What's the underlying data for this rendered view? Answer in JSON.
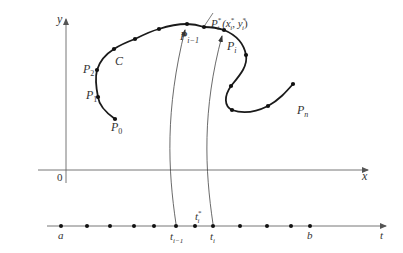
{
  "figure": {
    "colors": {
      "axis": "#555555",
      "curve": "#1a1a1a",
      "arrow_line": "#444444",
      "label": "#333333"
    },
    "axes": {
      "x_label": "x",
      "y_label": "y",
      "origin_label": "0"
    },
    "curve": {
      "name_label": "C",
      "points": [
        {
          "id": "P0",
          "label": "P",
          "sub": "0"
        },
        {
          "id": "P1",
          "label": "P",
          "sub": "1"
        },
        {
          "id": "P2",
          "label": "P",
          "sub": "2"
        },
        {
          "id": "P_i-1",
          "label": "P",
          "sub": "i−1"
        },
        {
          "id": "P_i",
          "label": "P",
          "sub": "i"
        },
        {
          "id": "P_n",
          "label": "P",
          "sub": "n"
        }
      ],
      "sample_point": {
        "label": "P",
        "sup": "*",
        "sub": "i",
        "coords_text": "(x",
        "x_sup": "*",
        "x_sub": "i",
        "comma": ", y",
        "y_sup": "*",
        "y_sub": "i",
        "close": ")"
      }
    },
    "t_axis": {
      "axis_label": "t",
      "labels": {
        "a": "a",
        "b": "b",
        "t_im1": "t",
        "t_im1_sub": "i−1",
        "t_i": "t",
        "t_i_sub": "i",
        "t_star": "t",
        "t_star_sup": "*",
        "t_star_sub": "i"
      },
      "tick_count": 12
    }
  }
}
